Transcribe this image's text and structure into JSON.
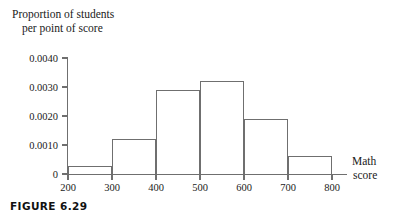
{
  "figure": {
    "caption": "FIGURE 6.29"
  },
  "chart_data": {
    "type": "bar",
    "title": "",
    "subtitle": "",
    "xlabel": "Math score",
    "xlabel_lines": [
      "Math",
      "score"
    ],
    "ylabel": "Proportion of students per point of score",
    "ylabel_lines": [
      "Proportion of students",
      "per point of score"
    ],
    "categories": [
      "200-300",
      "300-400",
      "400-500",
      "500-600",
      "600-700",
      "700-800"
    ],
    "bin_edges": [
      200,
      300,
      400,
      500,
      600,
      700,
      800
    ],
    "values": [
      0.00028,
      0.00122,
      0.0029,
      0.0032,
      0.0019,
      0.00062
    ],
    "xlim": [
      200,
      800
    ],
    "ylim": [
      0,
      0.004
    ],
    "xticks": [
      200,
      300,
      400,
      500,
      600,
      700,
      800
    ],
    "xtick_labels": [
      "200",
      "300",
      "400",
      "500",
      "600",
      "700",
      "800"
    ],
    "yticks": [
      0,
      0.001,
      0.002,
      0.003,
      0.004
    ],
    "ytick_labels": [
      "0",
      "0.0010",
      "0.0020",
      "0.0030",
      "0.0040"
    ],
    "grid": false,
    "legend": null,
    "bar_edge_color": "#6f6f6f",
    "bar_fill_color": "none",
    "axis_color": "#6f6f6f"
  }
}
